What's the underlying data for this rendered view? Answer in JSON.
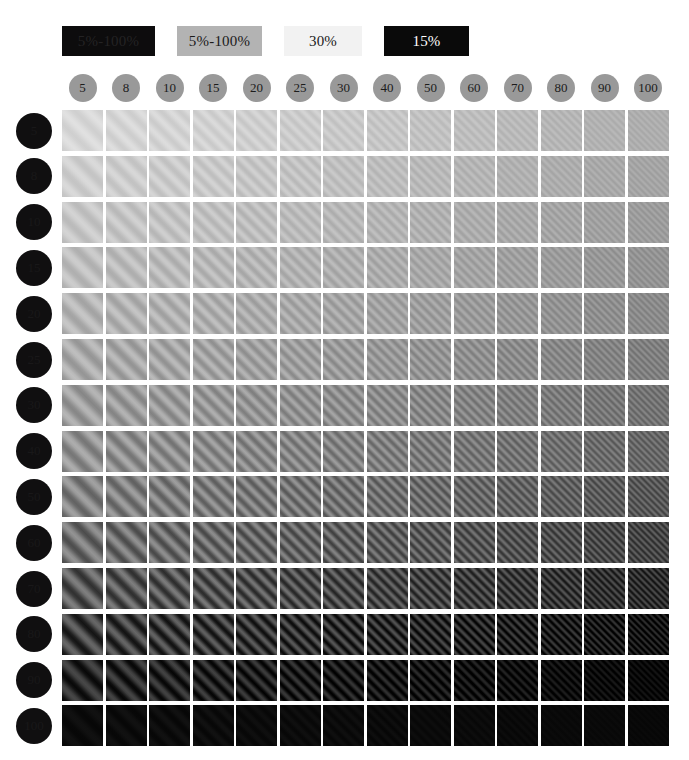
{
  "title": "Contrast sensitivity grating chart",
  "legend": {
    "items": [
      {
        "label": "5%-100%",
        "bg": "#0d0c0d",
        "fg": "#242324"
      },
      {
        "label": "5%-100%",
        "bg": "#b3b3b3",
        "fg": "#1a1a1a"
      },
      {
        "label": "30%",
        "bg": "#f2f2f2",
        "fg": "#1a1a1a"
      },
      {
        "label": "15%",
        "bg": "#0a0a0a",
        "fg": "#ffffff"
      }
    ]
  },
  "axes": {
    "columns_label": "Spatial frequency",
    "rows_label": "Contrast level",
    "columns": [
      "5",
      "8",
      "10",
      "15",
      "20",
      "25",
      "30",
      "40",
      "50",
      "60",
      "70",
      "80",
      "90",
      "100"
    ],
    "rows": [
      "5",
      "8",
      "10",
      "15",
      "20",
      "25",
      "30",
      "40",
      "50",
      "60",
      "70",
      "80",
      "90",
      "100"
    ],
    "column_circle_color": "#999999",
    "column_text_color": "#1c1c1c",
    "row_circle_color": "#100f10",
    "row_text_color": "#191819"
  },
  "chart_data": {
    "type": "heatmap",
    "title": "Contrast sensitivity grating chart",
    "xlabel": "Spatial frequency",
    "ylabel": "Contrast level",
    "x": [
      5,
      8,
      10,
      15,
      20,
      25,
      30,
      40,
      50,
      60,
      70,
      80,
      90,
      100
    ],
    "y": [
      5,
      8,
      10,
      15,
      20,
      25,
      30,
      40,
      50,
      60,
      70,
      80,
      90,
      100
    ],
    "grid": false,
    "legend_position": "top-left",
    "cell_render": "sinusoidal-grating",
    "grating_orientation_deg": 45,
    "note": "Each cell is a diagonal sinusoidal grating patch. Mean luminance decreases down the rows; grating period decreases across the columns.",
    "cell_mean_luminance": [
      [
        216,
        214,
        212,
        210,
        207,
        204,
        201,
        198,
        194,
        190,
        186,
        182,
        178,
        174
      ],
      [
        207,
        205,
        203,
        201,
        198,
        195,
        192,
        189,
        185,
        181,
        177,
        173,
        169,
        165
      ],
      [
        199,
        197,
        195,
        193,
        190,
        187,
        184,
        181,
        177,
        173,
        169,
        165,
        161,
        157
      ],
      [
        190,
        188,
        186,
        184,
        181,
        178,
        175,
        172,
        168,
        164,
        160,
        156,
        152,
        148
      ],
      [
        181,
        179,
        177,
        175,
        172,
        169,
        166,
        163,
        159,
        155,
        151,
        147,
        143,
        139
      ],
      [
        170,
        168,
        166,
        164,
        161,
        158,
        155,
        152,
        148,
        144,
        140,
        136,
        132,
        128
      ],
      [
        158,
        156,
        154,
        152,
        149,
        146,
        143,
        140,
        136,
        132,
        128,
        124,
        120,
        116
      ],
      [
        146,
        144,
        142,
        140,
        137,
        134,
        131,
        128,
        124,
        120,
        116,
        112,
        108,
        104
      ],
      [
        130,
        128,
        126,
        124,
        121,
        118,
        115,
        112,
        108,
        104,
        100,
        96,
        92,
        88
      ],
      [
        112,
        110,
        108,
        106,
        103,
        100,
        97,
        94,
        90,
        86,
        82,
        78,
        74,
        70
      ],
      [
        88,
        86,
        84,
        82,
        79,
        76,
        73,
        70,
        66,
        62,
        58,
        54,
        50,
        46
      ],
      [
        62,
        60,
        58,
        56,
        53,
        50,
        47,
        44,
        40,
        36,
        32,
        28,
        24,
        20
      ],
      [
        40,
        38,
        36,
        34,
        31,
        28,
        26,
        23,
        20,
        17,
        15,
        13,
        11,
        9
      ],
      [
        12,
        12,
        12,
        12,
        11,
        11,
        11,
        10,
        10,
        10,
        9,
        9,
        9,
        8
      ]
    ],
    "cell_contrast_amplitude": [
      [
        9,
        9,
        9,
        9,
        9,
        9,
        9,
        9,
        8,
        8,
        8,
        8,
        7,
        7
      ],
      [
        11,
        11,
        11,
        11,
        11,
        11,
        10,
        10,
        10,
        10,
        9,
        9,
        9,
        8
      ],
      [
        13,
        13,
        13,
        13,
        13,
        12,
        12,
        12,
        12,
        11,
        11,
        11,
        10,
        10
      ],
      [
        15,
        15,
        15,
        15,
        15,
        14,
        14,
        14,
        13,
        13,
        13,
        12,
        12,
        11
      ],
      [
        18,
        18,
        18,
        18,
        17,
        17,
        17,
        16,
        16,
        15,
        15,
        14,
        14,
        13
      ],
      [
        21,
        21,
        21,
        21,
        20,
        20,
        20,
        19,
        19,
        18,
        18,
        17,
        16,
        16
      ],
      [
        24,
        24,
        24,
        24,
        23,
        23,
        23,
        22,
        22,
        21,
        20,
        20,
        19,
        18
      ],
      [
        28,
        28,
        28,
        27,
        27,
        27,
        26,
        26,
        25,
        24,
        24,
        23,
        22,
        21
      ],
      [
        32,
        32,
        32,
        31,
        31,
        31,
        30,
        29,
        29,
        28,
        27,
        26,
        25,
        24
      ],
      [
        36,
        36,
        36,
        35,
        35,
        34,
        34,
        33,
        32,
        31,
        30,
        29,
        28,
        27
      ],
      [
        40,
        40,
        40,
        39,
        39,
        38,
        37,
        36,
        35,
        34,
        33,
        32,
        30,
        29
      ],
      [
        42,
        42,
        42,
        41,
        40,
        40,
        39,
        38,
        36,
        35,
        33,
        31,
        29,
        27
      ],
      [
        32,
        32,
        31,
        31,
        30,
        29,
        28,
        26,
        24,
        22,
        20,
        17,
        14,
        11
      ],
      [
        5,
        5,
        5,
        5,
        4,
        4,
        4,
        4,
        3,
        3,
        3,
        2,
        2,
        2
      ]
    ],
    "cell_period_px": [
      18,
      15,
      13,
      11,
      10,
      9,
      8.5,
      7.5,
      7,
      6.5,
      6,
      5.5,
      5,
      4.6
    ]
  },
  "layout": {
    "grid_left": 62,
    "grid_top": 110,
    "cell_size": 41,
    "cell_pitch": 43.5,
    "background": "#ffffff"
  }
}
